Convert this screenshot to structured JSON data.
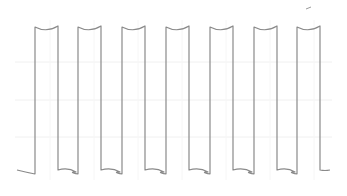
{
  "chart_data": {
    "type": "line",
    "title": "",
    "xlabel": "",
    "ylabel": "",
    "grid": true,
    "legend": null,
    "series": [
      {
        "name": "signal",
        "color": "#8a8a8a",
        "low_level": 0,
        "high_level": 1,
        "pulse_count": 7,
        "period_px": 43.8,
        "pulses_x_px": [
          [
            35,
            58
          ],
          [
            78,
            101
          ],
          [
            122,
            145
          ],
          [
            166,
            189
          ],
          [
            210,
            233
          ],
          [
            254,
            277
          ],
          [
            297,
            320
          ]
        ],
        "x_start_px": 17,
        "x_end_px": 330,
        "y_high_px": 27,
        "y_low_px": 172
      }
    ],
    "ylim": [
      0,
      1
    ]
  },
  "colors": {
    "background": "#ffffff",
    "trace": "#8a8a8a",
    "grid": "#f0f0f0"
  }
}
